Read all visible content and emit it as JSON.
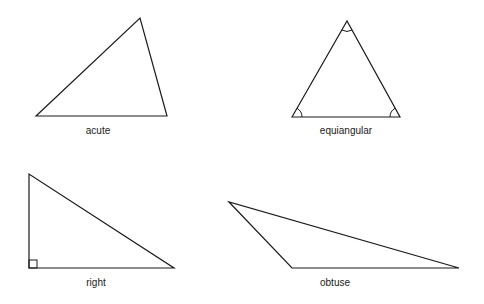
{
  "diagram": {
    "title": "",
    "stroke_color": "#1a1a1a",
    "background": "#ffffff",
    "triangles": [
      {
        "name": "acute",
        "label": "acute",
        "points": "36,116 140,18 167,116",
        "label_x": 98,
        "label_y": 134
      },
      {
        "name": "equiangular",
        "label": "equiangular",
        "points": "292,117 347,21 400,117",
        "label_x": 346,
        "label_y": 134
      },
      {
        "name": "right",
        "label": "right",
        "points": "29,174 29,268 174,268",
        "label_x": 96,
        "label_y": 286
      },
      {
        "name": "obtuse",
        "label": "obtuse",
        "points": "229,202 292,268 459,268",
        "label_x": 335,
        "label_y": 286
      }
    ]
  }
}
